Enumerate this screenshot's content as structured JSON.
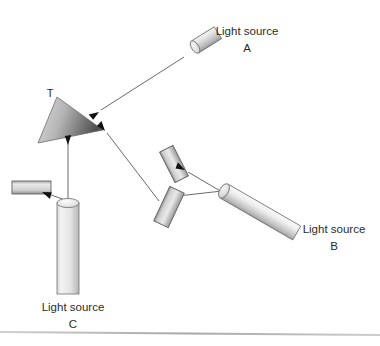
{
  "figure": {
    "background_color": "#ffffff",
    "line_color": "#5a5a5a",
    "arrow_color": "#111111",
    "text_color": "#2b2b2b",
    "baseline_rule_color": "#b9b9b9",
    "target": {
      "id": "T",
      "label": "T",
      "shape": "triangle",
      "label_x": 50,
      "label_y": 97,
      "vertices": "57,97 103,130 38,143",
      "fill_light": "#d8d8d8",
      "fill_dark": "#5f5f5f"
    },
    "sources": [
      {
        "id": "A",
        "label_line1": "Light source",
        "label_line2": "A",
        "label_x": 247,
        "label_y1": 33,
        "label_y2": 51,
        "shape": "cylinder-small-tilted",
        "beam_from_x": 180,
        "beam_from_y": 55,
        "beam_to_x": 99,
        "beam_to_y": 111
      },
      {
        "id": "B",
        "label_line1": "Light source",
        "label_line2": "B",
        "label_x": 335,
        "label_y1": 230,
        "label_y2": 248,
        "shape": "cylinder-long-diagonal",
        "beam_from_x": 222,
        "beam_from_y": 190,
        "beam_to_x": 105,
        "beam_to_y": 132
      },
      {
        "id": "C",
        "label_line1": "Light source",
        "label_line2": "C",
        "label_x": 73,
        "label_y1": 308,
        "label_y2": 326,
        "shape": "cylinder-vertical",
        "beam_from_x": 68,
        "beam_from_y": 203,
        "beam_to_x": 68,
        "beam_to_y": 147
      }
    ],
    "mirrors": [
      {
        "id": "mirror-b-upper",
        "angle_deg": -27,
        "cx": 174,
        "cy": 164,
        "w": 15,
        "h": 33
      },
      {
        "id": "mirror-b-lower",
        "angle_deg": 25,
        "cx": 169,
        "cy": 206,
        "w": 15,
        "h": 38
      },
      {
        "id": "mirror-c-left",
        "angle_deg": 0,
        "cx": 31,
        "cy": 187,
        "w": 38,
        "h": 13
      }
    ],
    "beam_paths": [
      {
        "id": "beam-a-to-t",
        "points": "185,57 99,111"
      },
      {
        "id": "beam-b-to-mirror-upper",
        "points": "222,192 187,172"
      },
      {
        "id": "beam-mirror-lower-to-b",
        "points": "180,196 222,191"
      },
      {
        "id": "beam-mirror-to-t",
        "points": "158,202 106,133"
      },
      {
        "id": "beam-c-to-t",
        "points": "68,203 68,148"
      },
      {
        "id": "beam-c-to-mirror-left",
        "points": "75,204 41,191"
      },
      {
        "id": "beam-c-stem-top",
        "points": "68,190 68,120"
      }
    ],
    "arrowheads": [
      {
        "id": "arrow-into-t-from-a",
        "x": 99,
        "y": 111,
        "angle_deg": 147
      },
      {
        "id": "arrow-into-t-from-b",
        "x": 105,
        "y": 132,
        "angle_deg": 233
      },
      {
        "id": "arrow-into-t-from-c",
        "x": 68,
        "y": 147,
        "angle_deg": 270
      },
      {
        "id": "arrow-into-mirror-upper",
        "x": 186,
        "y": 171,
        "angle_deg": 208
      },
      {
        "id": "arrow-into-mirror-left",
        "x": 41,
        "y": 191,
        "angle_deg": 20
      }
    ],
    "baseline_rule": {
      "x1": 0,
      "y1": 332,
      "x2": 380,
      "y2": 335
    }
  }
}
